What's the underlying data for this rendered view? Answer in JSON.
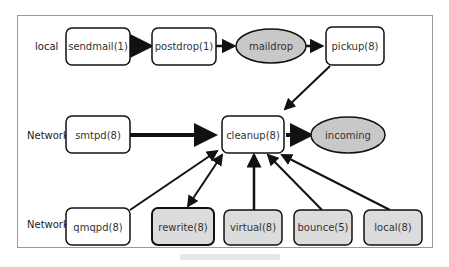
{
  "diagram": {
    "row_labels": {
      "local": "local",
      "network_1": "Network",
      "network_2": "Network"
    },
    "nodes": [
      {
        "id": "sendmail",
        "label": "sendmail(1)",
        "shape": "box",
        "fill": "#ffffff"
      },
      {
        "id": "postdrop",
        "label": "postdrop(1)",
        "shape": "box",
        "fill": "#ffffff"
      },
      {
        "id": "maildrop",
        "label": "maildrop",
        "shape": "ellipse",
        "fill": "#c8c8c8"
      },
      {
        "id": "pickup",
        "label": "pickup(8)",
        "shape": "box",
        "fill": "#ffffff"
      },
      {
        "id": "smtpd",
        "label": "smtpd(8)",
        "shape": "box",
        "fill": "#ffffff"
      },
      {
        "id": "cleanup",
        "label": "cleanup(8)",
        "shape": "box",
        "fill": "#ffffff"
      },
      {
        "id": "incoming",
        "label": "incoming",
        "shape": "ellipse",
        "fill": "#c8c8c8"
      },
      {
        "id": "qmqpd",
        "label": "qmqpd(8)",
        "shape": "box",
        "fill": "#ffffff"
      },
      {
        "id": "rewrite",
        "label": "rewrite(8)",
        "shape": "box",
        "fill": "#dcdcdc"
      },
      {
        "id": "virtual",
        "label": "virtual(8)",
        "shape": "box",
        "fill": "#dcdcdc"
      },
      {
        "id": "bounce",
        "label": "bounce(5)",
        "shape": "box",
        "fill": "#dcdcdc"
      },
      {
        "id": "local",
        "label": "local(8)",
        "shape": "box",
        "fill": "#dcdcdc"
      }
    ],
    "edges": [
      {
        "from": "sendmail",
        "to": "postdrop"
      },
      {
        "from": "postdrop",
        "to": "maildrop"
      },
      {
        "from": "maildrop",
        "to": "pickup"
      },
      {
        "from": "pickup",
        "to": "cleanup"
      },
      {
        "from": "smtpd",
        "to": "cleanup"
      },
      {
        "from": "cleanup",
        "to": "incoming"
      },
      {
        "from": "qmqpd",
        "to": "cleanup"
      },
      {
        "from": "rewrite",
        "to": "cleanup",
        "bidirectional": true
      },
      {
        "from": "virtual",
        "to": "cleanup"
      },
      {
        "from": "bounce",
        "to": "cleanup"
      },
      {
        "from": "local",
        "to": "cleanup"
      }
    ]
  }
}
